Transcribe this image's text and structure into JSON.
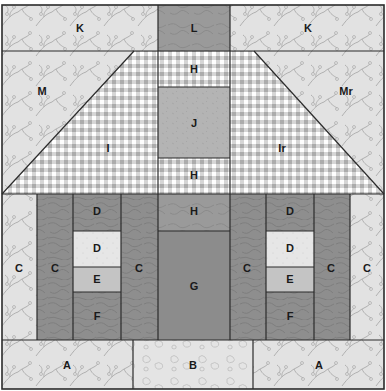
{
  "diagram": {
    "colors": {
      "floral_light": "#e2e2e2",
      "floral_line": "#b4b4b4",
      "gingham_base": "#ffffff",
      "gingham_band": "#cacaca",
      "gingham_cross": "#a9a9a9",
      "dark_texture": "#8e8e8e",
      "dark_texture_line": "#7a7a7a",
      "mid_gray": "#b4b4b4",
      "very_light": "#e6e6e6",
      "e_gray": "#c4c4c4",
      "g_dark": "#8c8c8c",
      "b_light": "#e4e4e4",
      "outline": "#2b2b2b"
    },
    "pieces": [
      {
        "id": "K_left",
        "label": "K"
      },
      {
        "id": "L",
        "label": "L"
      },
      {
        "id": "K_right",
        "label": "K"
      },
      {
        "id": "M",
        "label": "M"
      },
      {
        "id": "I",
        "label": "I"
      },
      {
        "id": "H_top",
        "label": "H"
      },
      {
        "id": "J",
        "label": "J"
      },
      {
        "id": "H_mid",
        "label": "H"
      },
      {
        "id": "Ir",
        "label": "Ir"
      },
      {
        "id": "Mr",
        "label": "Mr"
      },
      {
        "id": "C_outer_left",
        "label": "C"
      },
      {
        "id": "C_left_1",
        "label": "C"
      },
      {
        "id": "D_left_top",
        "label": "D"
      },
      {
        "id": "D_left_window",
        "label": "D"
      },
      {
        "id": "E_left",
        "label": "E"
      },
      {
        "id": "F_left",
        "label": "F"
      },
      {
        "id": "C_left_2",
        "label": "C"
      },
      {
        "id": "H_door_top",
        "label": "H"
      },
      {
        "id": "G",
        "label": "G"
      },
      {
        "id": "C_right_1",
        "label": "C"
      },
      {
        "id": "D_right_top",
        "label": "D"
      },
      {
        "id": "D_right_window",
        "label": "D"
      },
      {
        "id": "E_right",
        "label": "E"
      },
      {
        "id": "F_right",
        "label": "F"
      },
      {
        "id": "C_right_2",
        "label": "C"
      },
      {
        "id": "C_outer_right",
        "label": "C"
      },
      {
        "id": "A_left",
        "label": "A"
      },
      {
        "id": "B",
        "label": "B"
      },
      {
        "id": "A_right",
        "label": "A"
      }
    ]
  }
}
